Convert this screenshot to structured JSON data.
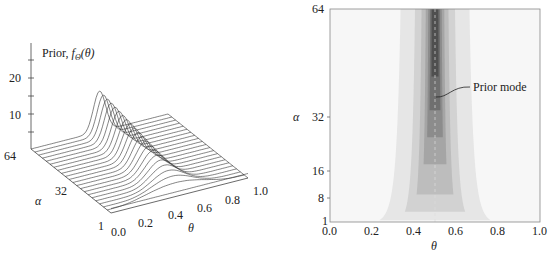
{
  "chart_data": [
    {
      "type": "surface",
      "panel": "left",
      "title": "",
      "zlabel": "Prior, fΘ(θ)",
      "zticks": [
        "10",
        "20"
      ],
      "xlabel": "θ",
      "xticks": [
        "0.0",
        "0.2",
        "0.4",
        "0.6",
        "0.8",
        "1.0"
      ],
      "ylabel": "α",
      "yticks": [
        "1",
        "32",
        "64"
      ],
      "zlim": [
        0,
        30
      ],
      "description": "Wireframe of symmetric Beta(α, α) prior density over θ ∈ [0,1] for α from 1 to 64; density peaks at θ = 0.5 and grows with α (peak ≈ 14 at α = 64).",
      "series_alpha": [
        1,
        8,
        16,
        24,
        32,
        40,
        48,
        56,
        64
      ],
      "peak_values": [
        1.0,
        3.1,
        4.4,
        5.4,
        6.3,
        7.1,
        7.7,
        8.3,
        14.0
      ]
    },
    {
      "type": "contour",
      "panel": "right",
      "xlabel": "θ",
      "xticks": [
        "0.0",
        "0.2",
        "0.4",
        "0.6",
        "0.8",
        "1.0"
      ],
      "xlim": [
        0.0,
        1.0
      ],
      "ylabel": "α",
      "yticks": [
        "1",
        "8",
        "16",
        "32",
        "64"
      ],
      "ylim": [
        1,
        64
      ],
      "annotation": "Prior mode",
      "mode_theta": 0.5,
      "description": "Filled contour of prior density; darker near θ = 0.5, band narrows as α increases. Dashed line marks prior mode at θ = 0.5.",
      "contour_levels_gray": [
        "#e6e6e6",
        "#d2d2d2",
        "#bdbdbd",
        "#a5a5a5",
        "#8c8c8c",
        "#6f6f6f",
        "#4f4f4f"
      ]
    }
  ],
  "left": {
    "zlabel_prefix": "Prior, ",
    "zlabel_func": "f",
    "zlabel_sub": "Θ",
    "zlabel_arg": "(θ)",
    "z20": "20",
    "z10": "10",
    "a64": "64",
    "a32": "32",
    "a1": "1",
    "alpha": "α",
    "theta": "θ",
    "x0": "0.0",
    "x2": "0.2",
    "x4": "0.4",
    "x6": "0.6",
    "x8": "0.8",
    "x10": "1.0"
  },
  "right": {
    "y64": "64",
    "y32": "32",
    "y16": "16",
    "y8": "8",
    "y1": "1",
    "alpha": "α",
    "theta": "θ",
    "x0": "0.0",
    "x2": "0.2",
    "x4": "0.4",
    "x6": "0.6",
    "x8": "0.8",
    "x10": "1.0",
    "annotation": "Prior mode"
  }
}
